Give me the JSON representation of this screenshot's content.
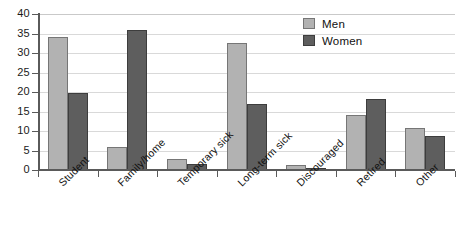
{
  "chart_data": {
    "type": "bar",
    "title": "",
    "xlabel": "",
    "ylabel": "",
    "ylim": [
      0,
      40
    ],
    "yticks": [
      0,
      5,
      10,
      15,
      20,
      25,
      30,
      35,
      40
    ],
    "ytick_labels": [
      "0",
      "5",
      "10",
      "15",
      "20",
      "25",
      "30",
      "35",
      "40"
    ],
    "grid": true,
    "legend_position": "top-right",
    "categories": [
      "Student",
      "Family/home",
      "Temporary sick",
      "Long-term sick",
      "Discouraged",
      "Retired",
      "Other"
    ],
    "series": [
      {
        "name": "Men",
        "color": "#b2b2b2",
        "values": [
          34,
          6,
          2.8,
          32.5,
          1.3,
          14,
          10.8
        ]
      },
      {
        "name": "Women",
        "color": "#5e5e5e",
        "values": [
          19.7,
          35.8,
          1.5,
          16.8,
          0.4,
          18.3,
          8.8
        ]
      }
    ]
  },
  "legend": {
    "items": [
      {
        "label": "Men",
        "color": "#b2b2b2"
      },
      {
        "label": "Women",
        "color": "#5e5e5e"
      }
    ]
  },
  "colors": {
    "men": "#b2b2b2",
    "women": "#5e5e5e",
    "gridline": "#d9d9d9",
    "axis": "#5a5a5a",
    "text": "#111111",
    "background": "#ffffff"
  }
}
